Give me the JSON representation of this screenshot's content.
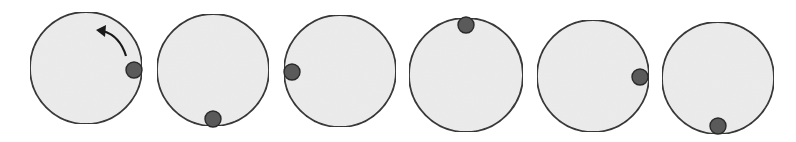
{
  "diagram": {
    "colors": {
      "background": "#ffffff",
      "circle_fill": "#ececec",
      "circle_stroke": "#2a2a2a",
      "ball_fill": "#5a5a5a",
      "ball_stroke": "#2a2a2a",
      "arrow": "#1a1a1a"
    },
    "frames": [
      {
        "cx": 86,
        "cy": 68,
        "r": 56,
        "ball_position": "right",
        "ball": {
          "cx": 134,
          "cy": 70,
          "r": 8
        }
      },
      {
        "cx": 213,
        "cy": 70,
        "r": 56,
        "ball_position": "bottom",
        "ball": {
          "cx": 213,
          "cy": 119,
          "r": 8
        }
      },
      {
        "cx": 340,
        "cy": 71,
        "r": 56,
        "ball_position": "left",
        "ball": {
          "cx": 292,
          "cy": 72,
          "r": 8
        }
      },
      {
        "cx": 466,
        "cy": 75,
        "r": 57,
        "ball_position": "top",
        "ball": {
          "cx": 466,
          "cy": 25,
          "r": 8
        }
      },
      {
        "cx": 593,
        "cy": 76,
        "r": 56,
        "ball_position": "right",
        "ball": {
          "cx": 640,
          "cy": 77,
          "r": 8
        }
      },
      {
        "cx": 718,
        "cy": 78,
        "r": 56,
        "ball_position": "bottom",
        "ball": {
          "cx": 718,
          "cy": 126,
          "r": 8
        }
      }
    ],
    "arrow": {
      "frame_index": 0,
      "direction": "counterclockwise",
      "path": "M 126 56 Q 120 36 103 31",
      "head": "96,30 106,25 105,37"
    }
  }
}
